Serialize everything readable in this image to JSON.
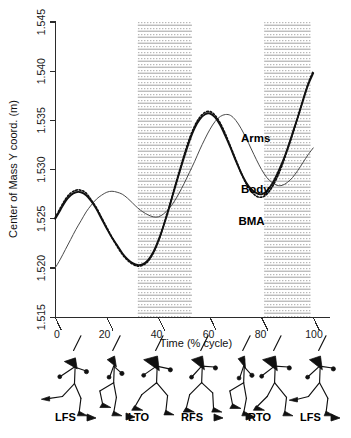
{
  "chart_data": {
    "type": "line",
    "title": "",
    "xlabel": "Time (% cycle)",
    "ylabel": "Center of Mass Y coord. (m)",
    "xlim": [
      0,
      100
    ],
    "ylim": [
      1.515,
      1.545
    ],
    "xticks": [
      "0",
      "20",
      "40",
      "60",
      "80",
      "100"
    ],
    "xtick_values": [
      0,
      20,
      40,
      60,
      80,
      100
    ],
    "yticks": [
      "1.515",
      "1.520",
      "1.525",
      "1.530",
      "1.535",
      "1.540",
      "1.545"
    ],
    "ytick_values": [
      1.515,
      1.52,
      1.525,
      1.53,
      1.535,
      1.54,
      1.545
    ],
    "grid": false,
    "legend_position": "inline-annotations",
    "x": [
      0,
      2,
      4,
      6,
      8,
      10,
      12,
      14,
      16,
      18,
      20,
      22,
      24,
      26,
      28,
      30,
      32,
      34,
      36,
      38,
      40,
      42,
      44,
      46,
      48,
      50,
      52,
      54,
      56,
      58,
      60,
      62,
      64,
      66,
      68,
      70,
      72,
      74,
      76,
      78,
      80,
      82,
      84,
      86,
      88,
      90,
      92,
      94,
      96,
      98,
      100
    ],
    "series": [
      {
        "name": "Body",
        "style": "solid-black",
        "values": [
          1.525,
          1.5259,
          1.5268,
          1.5274,
          1.5277,
          1.5277,
          1.5274,
          1.5268,
          1.526,
          1.525,
          1.524,
          1.5231,
          1.5223,
          1.5215,
          1.5209,
          1.5205,
          1.5203,
          1.5204,
          1.5208,
          1.5216,
          1.5228,
          1.5243,
          1.526,
          1.5278,
          1.5296,
          1.5313,
          1.5329,
          1.5342,
          1.5351,
          1.5356,
          1.5357,
          1.5353,
          1.5345,
          1.5334,
          1.5322,
          1.5309,
          1.5297,
          1.5287,
          1.528,
          1.5276,
          1.5275,
          1.5278,
          1.5285,
          1.5295,
          1.5307,
          1.5321,
          1.5337,
          1.5353,
          1.537,
          1.5386,
          1.5398
        ]
      },
      {
        "name": "BMA",
        "style": "dotted-black",
        "values": [
          1.5251,
          1.5261,
          1.527,
          1.5276,
          1.5279,
          1.5279,
          1.5276,
          1.5269,
          1.5261,
          1.5251,
          1.5241,
          1.5231,
          1.5222,
          1.5214,
          1.5208,
          1.5204,
          1.5202,
          1.5203,
          1.5207,
          1.5215,
          1.5227,
          1.5243,
          1.526,
          1.5279,
          1.5297,
          1.5315,
          1.5331,
          1.5344,
          1.5353,
          1.5358,
          1.5359,
          1.5355,
          1.5347,
          1.5336,
          1.5323,
          1.531,
          1.5297,
          1.5286,
          1.5278,
          1.5273,
          1.5272,
          1.5275,
          1.5282,
          1.5292,
          1.5305,
          1.532,
          1.5336,
          1.5353,
          1.537,
          1.5387,
          1.54
        ]
      },
      {
        "name": "Arms",
        "style": "thin-gray",
        "values": [
          1.52,
          1.5209,
          1.5219,
          1.5229,
          1.5239,
          1.5248,
          1.5257,
          1.5264,
          1.527,
          1.5274,
          1.5277,
          1.5278,
          1.5277,
          1.5275,
          1.5271,
          1.5266,
          1.5261,
          1.5257,
          1.5254,
          1.5252,
          1.5252,
          1.5255,
          1.526,
          1.5267,
          1.5276,
          1.5286,
          1.5297,
          1.5308,
          1.532,
          1.5331,
          1.5341,
          1.5349,
          1.5354,
          1.5356,
          1.5355,
          1.535,
          1.5342,
          1.5332,
          1.5321,
          1.531,
          1.53,
          1.5292,
          1.5287,
          1.5284,
          1.5284,
          1.5287,
          1.5292,
          1.5299,
          1.5307,
          1.5315,
          1.5322
        ]
      }
    ],
    "annotations": [
      {
        "text": "Arms",
        "x": 72,
        "y": 1.5332
      },
      {
        "text": "Body",
        "x": 72,
        "y": 1.528
      },
      {
        "text": "BMA",
        "x": 71,
        "y": 1.5248
      }
    ],
    "shaded_bands": [
      {
        "from": 32,
        "to": 53,
        "label": ""
      },
      {
        "from": 81,
        "to": 99,
        "label": ""
      }
    ]
  },
  "gait_events": [
    {
      "label": "LFS",
      "x": 2
    },
    {
      "label": "LTO",
      "x": 33
    },
    {
      "label": "RFS",
      "x": 50
    },
    {
      "label": "RTO",
      "x": 83
    },
    {
      "label": "LFS",
      "x": 99
    }
  ],
  "stick_figures": [
    {
      "index": 0,
      "x": 2
    },
    {
      "index": 1,
      "x": 18
    },
    {
      "index": 2,
      "x": 35
    },
    {
      "index": 3,
      "x": 52
    },
    {
      "index": 4,
      "x": 68
    },
    {
      "index": 5,
      "x": 84
    },
    {
      "index": 6,
      "x": 100
    }
  ]
}
